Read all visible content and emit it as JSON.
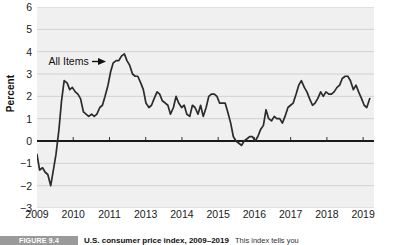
{
  "axes": {
    "ylabel": "Percent",
    "yticks": [
      "6",
      "5",
      "4",
      "3",
      "2",
      "1",
      "0",
      "−1",
      "−2",
      "−3"
    ],
    "xticks": [
      "2009",
      "2010",
      "2011",
      "2013",
      "2014",
      "2015",
      "2016",
      "2017",
      "2018",
      "2019"
    ]
  },
  "annotation": {
    "label": "All Items",
    "arrow_icon": "arrow-right-icon"
  },
  "caption": {
    "badge": "FIGURE 9.4",
    "title": "U.S. consumer price index, 2009–2019",
    "text": "This index tells you"
  },
  "colors": {
    "plot_background": "#f0f0f0",
    "gridline": "#c8c8c8",
    "zero_line": "#1a1a1a",
    "series_line": "#2b2b2b",
    "caption_badge": "#9a9a9a"
  },
  "chart_data": {
    "type": "line",
    "title": "U.S. consumer price index, 2009–2019",
    "xlabel": "",
    "ylabel": "Percent",
    "xlim": [
      2009.0,
      2019.3
    ],
    "ylim": [
      -3,
      6
    ],
    "grid": true,
    "legend": "none",
    "zero_line": 0,
    "annotations": [
      {
        "text": "All Items",
        "x": 2009.35,
        "y": 3.6,
        "arrow_to_x": 2010.6,
        "arrow_to_y": 3.6
      }
    ],
    "series": [
      {
        "name": "All Items",
        "x": [
          2009.0,
          2009.08,
          2009.17,
          2009.25,
          2009.33,
          2009.42,
          2009.5,
          2009.58,
          2009.67,
          2009.75,
          2009.83,
          2009.92,
          2010.0,
          2010.08,
          2010.17,
          2010.25,
          2010.33,
          2010.42,
          2010.5,
          2010.58,
          2010.67,
          2010.75,
          2010.83,
          2010.92,
          2011.0,
          2011.08,
          2011.17,
          2011.25,
          2011.33,
          2011.42,
          2011.5,
          2011.58,
          2011.67,
          2011.75,
          2011.83,
          2011.92,
          2012.0,
          2012.08,
          2012.17,
          2012.25,
          2012.33,
          2012.42,
          2012.5,
          2012.58,
          2012.67,
          2012.75,
          2012.83,
          2012.92,
          2013.0,
          2013.08,
          2013.17,
          2013.25,
          2013.33,
          2013.42,
          2013.5,
          2013.58,
          2013.67,
          2013.75,
          2013.83,
          2013.92,
          2014.0,
          2014.08,
          2014.17,
          2014.25,
          2014.33,
          2014.42,
          2014.5,
          2014.58,
          2014.67,
          2014.75,
          2014.83,
          2014.92,
          2015.0,
          2015.08,
          2015.17,
          2015.25,
          2015.33,
          2015.42,
          2015.5,
          2015.58,
          2015.67,
          2015.75,
          2015.83,
          2015.92,
          2016.0,
          2016.08,
          2016.17,
          2016.25,
          2016.33,
          2016.42,
          2016.5,
          2016.58,
          2016.67,
          2016.75,
          2016.83,
          2016.92,
          2017.0,
          2017.08,
          2017.17,
          2017.25,
          2017.33,
          2017.42,
          2017.5,
          2017.58,
          2017.67,
          2017.75,
          2017.83,
          2017.92,
          2018.0,
          2018.08,
          2018.17,
          2018.25,
          2018.33,
          2018.42,
          2018.5,
          2018.58,
          2018.67,
          2018.75,
          2018.83,
          2018.92,
          2019.0,
          2019.08,
          2019.17
        ],
        "values": [
          -0.6,
          -1.3,
          -1.2,
          -1.4,
          -1.5,
          -2.0,
          -1.3,
          -0.6,
          0.5,
          1.8,
          2.7,
          2.6,
          2.3,
          2.4,
          2.2,
          2.1,
          1.9,
          1.3,
          1.2,
          1.1,
          1.2,
          1.1,
          1.2,
          1.5,
          1.6,
          2.0,
          2.5,
          3.1,
          3.5,
          3.6,
          3.6,
          3.8,
          3.9,
          3.6,
          3.4,
          3.0,
          2.9,
          2.9,
          2.6,
          2.3,
          1.7,
          1.5,
          1.6,
          1.9,
          2.2,
          2.1,
          1.8,
          1.7,
          1.6,
          1.2,
          1.5,
          2.0,
          1.7,
          1.5,
          1.6,
          1.2,
          1.1,
          1.6,
          1.5,
          1.2,
          1.6,
          1.1,
          1.5,
          2.0,
          2.1,
          2.1,
          2.0,
          1.7,
          1.7,
          1.7,
          1.3,
          0.8,
          0.2,
          0.0,
          -0.1,
          -0.2,
          0.0,
          0.1,
          0.2,
          0.2,
          0.0,
          0.2,
          0.5,
          0.7,
          1.4,
          1.0,
          0.9,
          1.1,
          1.0,
          1.0,
          0.8,
          1.1,
          1.5,
          1.6,
          1.7,
          2.1,
          2.5,
          2.7,
          2.4,
          2.2,
          1.9,
          1.6,
          1.7,
          1.9,
          2.2,
          2.0,
          2.2,
          2.1,
          2.1,
          2.2,
          2.4,
          2.5,
          2.8,
          2.9,
          2.9,
          2.7,
          2.3,
          2.5,
          2.2,
          1.9,
          1.6,
          1.5,
          1.9
        ]
      }
    ]
  }
}
